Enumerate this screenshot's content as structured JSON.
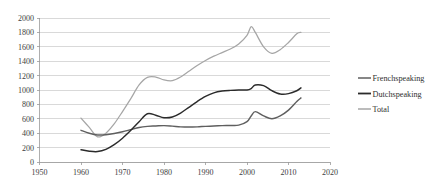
{
  "chart_data": {
    "type": "line",
    "title": "",
    "subtitle": "",
    "xlabel": "",
    "ylabel": "",
    "xlim": [
      1950,
      2020
    ],
    "ylim": [
      0,
      2000
    ],
    "x_ticks": [
      1950,
      1960,
      1970,
      1980,
      1990,
      2000,
      2010,
      2020
    ],
    "y_ticks": [
      0,
      200,
      400,
      600,
      800,
      1000,
      1200,
      1400,
      1600,
      1800,
      2000
    ],
    "grid": "horizontal",
    "legend_position": "right",
    "series": [
      {
        "name": "Frenchspeaking",
        "color": "#5f5f5f",
        "x": [
          1960,
          1962,
          1964,
          1966,
          1968,
          1970,
          1972,
          1974,
          1976,
          1978,
          1980,
          1982,
          1984,
          1986,
          1988,
          1990,
          1992,
          1994,
          1996,
          1998,
          2000,
          2001,
          2002,
          2004,
          2006,
          2008,
          2010,
          2012,
          2013
        ],
        "values": [
          440,
          400,
          375,
          378,
          395,
          420,
          450,
          480,
          495,
          500,
          505,
          498,
          488,
          485,
          488,
          495,
          500,
          505,
          508,
          512,
          560,
          640,
          700,
          640,
          600,
          640,
          720,
          840,
          890
        ]
      },
      {
        "name": "Dutchspeaking",
        "color": "#2b2b2b",
        "x": [
          1960,
          1962,
          1964,
          1966,
          1968,
          1970,
          1972,
          1974,
          1976,
          1978,
          1980,
          1982,
          1984,
          1986,
          1988,
          1990,
          1992,
          1994,
          1996,
          1998,
          2000,
          2001,
          2002,
          2004,
          2006,
          2008,
          2010,
          2012,
          2013
        ],
        "values": [
          170,
          150,
          145,
          175,
          240,
          330,
          440,
          560,
          670,
          650,
          615,
          625,
          680,
          760,
          840,
          910,
          960,
          985,
          995,
          1000,
          1000,
          1020,
          1070,
          1060,
          990,
          945,
          950,
          990,
          1030
        ]
      },
      {
        "name": "Total",
        "color": "#a6a6a6",
        "x": [
          1960,
          1962,
          1964,
          1966,
          1968,
          1970,
          1972,
          1974,
          1976,
          1978,
          1980,
          1982,
          1984,
          1986,
          1988,
          1990,
          1992,
          1994,
          1996,
          1998,
          2000,
          2001,
          2002,
          2004,
          2006,
          2008,
          2010,
          2012,
          2013
        ],
        "values": [
          610,
          480,
          350,
          400,
          530,
          700,
          880,
          1070,
          1175,
          1180,
          1140,
          1130,
          1180,
          1260,
          1340,
          1410,
          1470,
          1520,
          1570,
          1640,
          1760,
          1880,
          1800,
          1600,
          1510,
          1560,
          1660,
          1780,
          1800
        ]
      }
    ]
  },
  "legend": {
    "items": [
      {
        "label": "Frenchspeaking",
        "color": "#5f5f5f"
      },
      {
        "label": "Dutchspeaking",
        "color": "#2b2b2b"
      },
      {
        "label": "Total",
        "color": "#a6a6a6"
      }
    ]
  },
  "axes": {
    "x_tick_labels": [
      "1950",
      "1960",
      "1970",
      "1980",
      "1990",
      "2000",
      "2010",
      "2020"
    ],
    "y_tick_labels": [
      "0",
      "200",
      "400",
      "600",
      "800",
      "1000",
      "1200",
      "1400",
      "1600",
      "1800",
      "2000"
    ]
  },
  "colors": {
    "gridline": "#c9c9c9",
    "axis": "#9a9a9a",
    "text": "#3d3d3d",
    "background": "#ffffff"
  }
}
